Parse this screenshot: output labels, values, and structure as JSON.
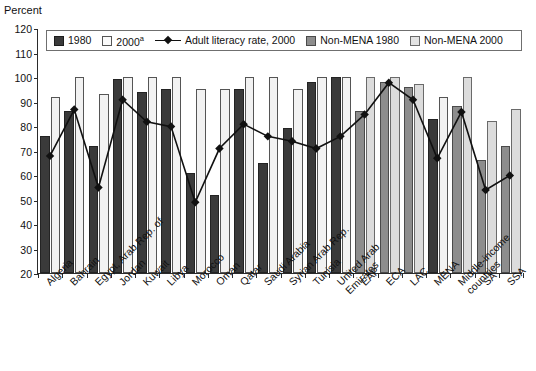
{
  "chart_data": {
    "type": "bar",
    "title": "",
    "subtitle": "",
    "xlabel": "",
    "ylabel": "Percent",
    "ylim": [
      20,
      120
    ],
    "ytick_values": [
      20,
      30,
      40,
      50,
      60,
      70,
      80,
      90,
      100,
      110,
      120
    ],
    "ytick_labels": [
      "20",
      "30",
      "40",
      "50",
      "60",
      "70",
      "80",
      "90",
      "100",
      "110",
      "120"
    ],
    "grid": false,
    "legend_position": "top-inside",
    "footnote_marker": "a",
    "categories": [
      "Algeria",
      "Bahrain",
      "Egypt, Arab Rep. of",
      "Jordan",
      "Kuwait",
      "Libya",
      "Morocco",
      "Oman",
      "Qatar",
      "Saudi Arabia",
      "Syrian Arab Rep.",
      "Tunisia",
      "United Arab Emirates",
      "EAP",
      "ECA",
      "LAC",
      "MENA",
      "Middle-income countries",
      "SA",
      "SSA"
    ],
    "category_groups": [
      "mena",
      "mena",
      "mena",
      "mena",
      "mena",
      "mena",
      "mena",
      "mena",
      "mena",
      "mena",
      "mena",
      "mena",
      "mena",
      "nonmena",
      "nonmena",
      "nonmena",
      "mena",
      "nonmena",
      "nonmena",
      "nonmena"
    ],
    "series": [
      {
        "name": "1980",
        "style": "dark",
        "values": [
          76,
          86,
          72,
          99,
          94,
          95,
          61,
          52,
          95,
          65,
          79,
          98,
          100,
          86,
          98,
          96,
          83,
          88,
          66,
          72
        ]
      },
      {
        "name": "2000",
        "style": "light",
        "values": [
          92,
          100,
          93,
          100,
          100,
          100,
          95,
          95,
          100,
          100,
          95,
          100,
          100,
          100,
          100,
          97,
          92,
          100,
          82,
          87
        ]
      },
      {
        "name": "Adult literacy rate, 2000",
        "style": "line",
        "values": [
          68,
          87,
          55,
          91,
          82,
          80,
          49,
          71,
          81,
          76,
          74,
          71,
          76,
          85,
          98,
          91,
          67,
          86,
          54,
          60
        ]
      }
    ],
    "legend": [
      {
        "label": "1980",
        "style": "dark",
        "sup": ""
      },
      {
        "label": "2000",
        "style": "light",
        "sup": "a"
      },
      {
        "label": "Adult literacy rate, 2000",
        "style": "line",
        "sup": ""
      },
      {
        "label": "Non-MENA 1980",
        "style": "graydark",
        "sup": ""
      },
      {
        "label": "Non-MENA 2000",
        "style": "graylight",
        "sup": ""
      }
    ],
    "colors": {
      "series_1980": "#3a3a3a",
      "series_2000": "#f2f2f2",
      "nonmena_1980": "#8d8d8d",
      "nonmena_2000": "#dcdcdc",
      "line": "#111111",
      "axis": "#2b2b2b"
    }
  }
}
